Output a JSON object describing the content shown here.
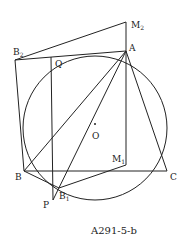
{
  "figure": {
    "caption": "A291-5-b",
    "points": {
      "A": {
        "label": "A"
      },
      "B": {
        "label": "B"
      },
      "C": {
        "label": "C"
      },
      "O": {
        "label": "O"
      },
      "P": {
        "label": "P"
      },
      "Q": {
        "label": "Q"
      },
      "B1": {
        "label": "B",
        "sub": "1"
      },
      "B2": {
        "label": "B",
        "sub": "2"
      },
      "M1": {
        "label": "M",
        "sub": "1"
      },
      "M2": {
        "label": "M",
        "sub": "2"
      }
    }
  }
}
